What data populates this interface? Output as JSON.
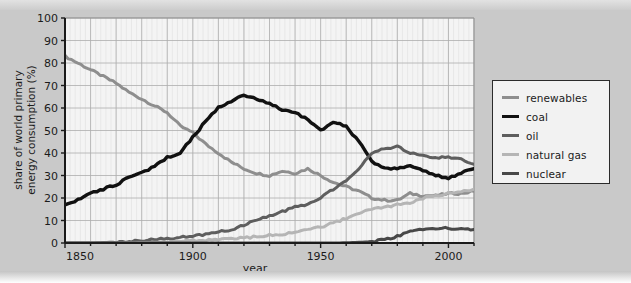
{
  "figure": {
    "background_color": "#c9c9c9",
    "plot_background_color": "#f4f4f4",
    "frame_color": "#1b1b1b"
  },
  "axes": {
    "xlabel": "year",
    "ylabel_line1": "share of world primary",
    "ylabel_line2": "energy consumption (%)",
    "xticks": [
      "1850",
      "1900",
      "1950",
      "2000"
    ],
    "xtick_values": [
      1850,
      1900,
      1950,
      2000
    ],
    "yticks": [
      "0",
      "10",
      "20",
      "30",
      "40",
      "50",
      "60",
      "70",
      "80",
      "90",
      "100"
    ],
    "ytick_values": [
      0,
      10,
      20,
      30,
      40,
      50,
      60,
      70,
      80,
      90,
      100
    ],
    "xlim": [
      1850,
      2010
    ],
    "ylim": [
      0,
      100
    ],
    "grid": "major x every 10 years, major y every 10 percent, faint minor vertical lines"
  },
  "legend": {
    "position": "right-outside",
    "items": [
      {
        "label": "renewables",
        "color": "#8e8e8e",
        "width": 3.0
      },
      {
        "label": "coal",
        "color": "#111111",
        "width": 3.4
      },
      {
        "label": "oil",
        "color": "#5e5e5e",
        "width": 3.0
      },
      {
        "label": "natural gas",
        "color": "#b5b5b5",
        "width": 3.0
      },
      {
        "label": "nuclear",
        "color": "#484848",
        "width": 3.0
      }
    ]
  },
  "chart_data": {
    "type": "line",
    "title": "",
    "subtitle": "",
    "xlabel": "year",
    "ylabel": "share of world primary energy consumption (%)",
    "xlim": [
      1850,
      2010
    ],
    "ylim": [
      0,
      100
    ],
    "grid": true,
    "legend_position": "right",
    "x": [
      1850,
      1855,
      1860,
      1865,
      1870,
      1875,
      1880,
      1885,
      1890,
      1895,
      1900,
      1905,
      1910,
      1915,
      1920,
      1925,
      1930,
      1935,
      1940,
      1945,
      1950,
      1955,
      1960,
      1965,
      1970,
      1975,
      1980,
      1985,
      1990,
      1995,
      2000,
      2005,
      2010
    ],
    "series": [
      {
        "name": "renewables",
        "color": "#8e8e8e",
        "values": [
          83,
          80,
          77,
          74,
          71,
          67,
          64,
          61,
          58,
          52,
          49,
          44,
          40,
          36,
          33,
          31,
          30,
          32,
          31,
          33,
          30,
          27,
          25,
          23,
          20,
          19,
          19,
          22,
          21,
          21,
          22,
          22,
          23
        ],
        "note": "traditional biomass dominated in 1850 (~83%), declining steadily to about 22-23% by 2010"
      },
      {
        "name": "coal",
        "color": "#111111",
        "values": [
          17,
          19,
          22,
          24,
          26,
          29,
          31,
          34,
          38,
          40,
          47,
          54,
          60,
          63,
          66,
          64,
          62,
          59,
          58,
          55,
          50,
          54,
          52,
          45,
          36,
          33,
          33,
          34,
          32,
          30,
          29,
          31,
          33
        ],
        "note": "rises to a peak near 66% around 1915-1920, declines to ~29% by 2000, small rebound after"
      },
      {
        "name": "oil",
        "color": "#5e5e5e",
        "values": [
          0,
          0,
          0,
          0.2,
          0.4,
          0.7,
          1,
          1.5,
          2,
          2.5,
          3,
          4,
          5,
          6,
          8,
          10,
          12,
          14,
          16,
          17,
          20,
          24,
          28,
          33,
          40,
          42,
          43,
          40,
          39,
          38,
          38,
          37,
          35
        ],
        "note": "negligible until about 1880, strong growth after 1940, peaks near 44% around 1975, then ~35-38%"
      },
      {
        "name": "natural gas",
        "color": "#b5b5b5",
        "values": [
          0,
          0,
          0,
          0,
          0,
          0.1,
          0.2,
          0.3,
          0.5,
          0.7,
          1,
          1.2,
          1.5,
          1.8,
          2.2,
          2.8,
          3.5,
          4,
          5,
          6,
          7,
          9,
          11,
          13,
          15,
          16,
          17,
          18,
          20,
          21,
          22,
          23,
          24
        ],
        "note": "steady growth from near zero to about 24% by 2010"
      },
      {
        "name": "nuclear",
        "color": "#484848",
        "values": [
          0,
          0,
          0,
          0,
          0,
          0,
          0,
          0,
          0,
          0,
          0,
          0,
          0,
          0,
          0,
          0,
          0,
          0,
          0,
          0,
          0,
          0,
          0.1,
          0.3,
          0.6,
          1.5,
          3,
          5,
          6,
          6.5,
          6.5,
          6.2,
          6
        ],
        "note": "zero until the mid 1960s, rising to roughly 6-7% by 1990 and then flat"
      }
    ]
  }
}
